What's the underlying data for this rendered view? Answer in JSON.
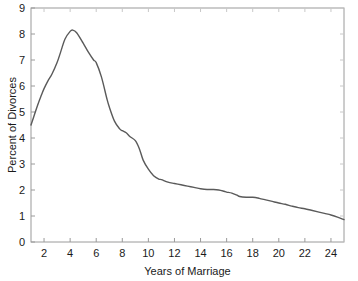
{
  "chart_data": {
    "type": "line",
    "title": "",
    "xlabel": "Years of Marriage",
    "ylabel": "Percent of Divorces",
    "xlim": [
      1,
      25
    ],
    "ylim": [
      0,
      9
    ],
    "grid": false,
    "legend": null,
    "xticks": [
      2,
      4,
      6,
      8,
      10,
      12,
      14,
      16,
      18,
      20,
      22,
      24
    ],
    "xtick_labels": [
      "2",
      "4",
      "6",
      "8",
      "10",
      "12",
      "14",
      "16",
      "18",
      "20",
      "22",
      "24"
    ],
    "yticks": [
      0,
      1,
      2,
      3,
      4,
      5,
      6,
      7,
      8,
      9
    ],
    "ytick_labels": [
      "0",
      "1",
      "2",
      "3",
      "4",
      "5",
      "6",
      "7",
      "8",
      "9"
    ],
    "line_color": "#5a5a5a",
    "line_width": 1.4,
    "axis_color": "#8a8a8a",
    "background": "#ffffff",
    "series": [
      {
        "name": "Percent of Divorces",
        "x": [
          1.0,
          1.2,
          1.5,
          1.8,
          2.0,
          2.3,
          2.6,
          3.0,
          3.3,
          3.6,
          4.0,
          4.2,
          4.5,
          5.0,
          5.4,
          5.8,
          6.0,
          6.4,
          6.8,
          7.0,
          7.4,
          7.8,
          8.0,
          8.3,
          8.6,
          9.0,
          9.3,
          9.6,
          10.0,
          10.4,
          10.8,
          11.0,
          11.5,
          12.0,
          12.5,
          13.0,
          13.5,
          14.0,
          14.5,
          15.0,
          15.4,
          15.8,
          16.0,
          16.4,
          16.8,
          17.0,
          17.5,
          18.0,
          18.5,
          19.0,
          19.5,
          20.0,
          20.5,
          21.0,
          21.5,
          22.0,
          22.5,
          23.0,
          23.5,
          24.0,
          24.5,
          25.0
        ],
        "y": [
          4.5,
          4.8,
          5.25,
          5.65,
          5.9,
          6.2,
          6.45,
          6.9,
          7.35,
          7.8,
          8.1,
          8.15,
          8.05,
          7.65,
          7.3,
          7.0,
          6.9,
          6.35,
          5.55,
          5.2,
          4.65,
          4.35,
          4.28,
          4.2,
          4.05,
          3.9,
          3.6,
          3.15,
          2.8,
          2.55,
          2.42,
          2.4,
          2.3,
          2.25,
          2.2,
          2.15,
          2.1,
          2.05,
          2.02,
          2.02,
          2.0,
          1.95,
          1.92,
          1.88,
          1.8,
          1.75,
          1.72,
          1.72,
          1.68,
          1.62,
          1.56,
          1.5,
          1.45,
          1.38,
          1.32,
          1.28,
          1.22,
          1.16,
          1.1,
          1.04,
          0.96,
          0.86
        ]
      }
    ]
  },
  "axis_titles": {
    "x": "Years of Marriage",
    "y": "Percent of Divorces"
  }
}
